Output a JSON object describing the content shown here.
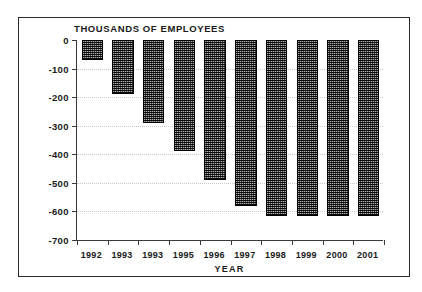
{
  "chart_data": {
    "type": "bar",
    "title": "THOUSANDS OF EMPLOYEES",
    "xlabel": "YEAR",
    "ylabel": "",
    "categories": [
      "1992",
      "1993",
      "1993",
      "1995",
      "1996",
      "1997",
      "1998",
      "1999",
      "2000",
      "2001"
    ],
    "values": [
      -70,
      -190,
      -290,
      -390,
      -490,
      -580,
      -615,
      -615,
      -615,
      -615
    ],
    "ylim": [
      -700,
      0
    ],
    "ytick_labels": [
      "0",
      "-100",
      "-200",
      "-300",
      "-400",
      "-500",
      "-600",
      "-700"
    ],
    "ytick_values": [
      0,
      -100,
      -200,
      -300,
      -400,
      -500,
      -600,
      -700
    ],
    "grid": true,
    "legend": "none",
    "bar_color": "#4a4a4a",
    "bar_edge_color": "#000000",
    "axis_color": "#3a3a3a",
    "grid_color": "#c9c9c9",
    "background_color": "#ffffff"
  }
}
